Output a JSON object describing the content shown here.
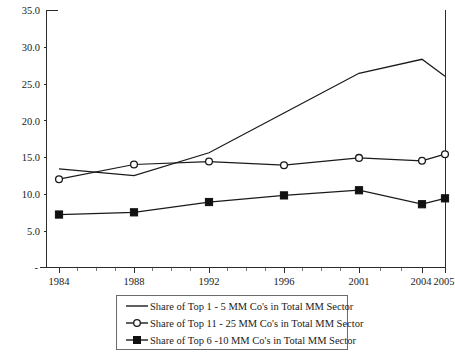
{
  "chart_data": {
    "type": "line",
    "title": "",
    "subtitle": "",
    "xlabel": "",
    "ylabel": "",
    "x": [
      "1984",
      "1988",
      "1992",
      "1996",
      "2001",
      "2004",
      "2005"
    ],
    "categories": [
      "1984",
      "1988",
      "1992",
      "1996",
      "2001",
      "2004",
      "2005"
    ],
    "ylim": [
      0,
      35
    ],
    "y_ticks": [
      "5.0",
      "10.0",
      "15.0",
      "20.0",
      "25.0",
      "30.0",
      "35.0"
    ],
    "y_tick_values": [
      5.0,
      10.0,
      15.0,
      20.0,
      25.0,
      30.0,
      35.0
    ],
    "grid": false,
    "legend_position": "bottom",
    "series": [
      {
        "name": "Share of Top 1 - 5 MM Co's in Total MM Sector",
        "marker": "none",
        "values": [
          13.4,
          12.5,
          15.6,
          21.0,
          26.4,
          28.3,
          26.0
        ]
      },
      {
        "name": "Share of Top 11 - 25 MM Co's in Total MM Sector",
        "marker": "open-circle",
        "values": [
          12.0,
          14.0,
          14.4,
          13.9,
          14.9,
          14.5,
          15.4
        ]
      },
      {
        "name": "Share of Top 6 -10 MM Co's in Total MM Sector",
        "marker": "filled-square",
        "values": [
          7.2,
          7.5,
          8.9,
          9.8,
          10.5,
          8.6,
          9.4
        ]
      }
    ],
    "colors": {
      "line": "#1a1a1a",
      "axis": "#2b2b2b",
      "marker_fill_open": "#ffffff",
      "marker_fill_solid": "#111111",
      "background": "#ffffff",
      "legend_border": "#6b6b6b"
    }
  },
  "axes": {
    "y_tick_labels": [
      "35.0",
      "30.0",
      "25.0",
      "20.0",
      "15.0",
      "10.0",
      "5.0"
    ],
    "zero_tick_label": "-",
    "x_tick_labels": [
      "1984",
      "1988",
      "1992",
      "1996",
      "2001",
      "2004",
      "2005"
    ]
  },
  "legend": {
    "items": [
      {
        "label": "Share of Top 1 - 5 MM Co's in Total MM Sector",
        "marker": "none"
      },
      {
        "label": "Share of Top 11 - 25 MM Co's in Total MM Sector",
        "marker": "open-circle"
      },
      {
        "label": "Share of Top 6 -10 MM Co's in Total MM Sector",
        "marker": "filled-square"
      }
    ]
  }
}
